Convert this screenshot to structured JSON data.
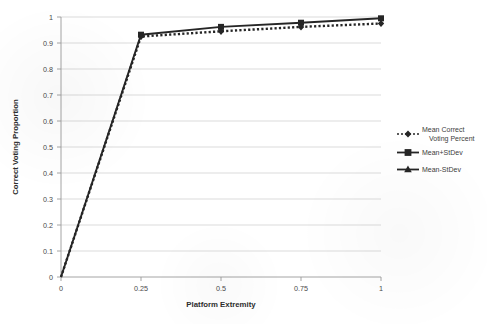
{
  "chart_data": {
    "type": "line",
    "title": "",
    "xlabel": "Platform Extremity",
    "ylabel": "Correct Voting Proportion",
    "x": [
      0,
      0.25,
      0.5,
      0.75,
      1
    ],
    "xticklabels": [
      "0",
      "0.25",
      "0.5",
      "0.75",
      "1"
    ],
    "yticklabels": [
      "0",
      "0.1",
      "0.2",
      "0.3",
      "0.4",
      "0.5",
      "0.6",
      "0.7",
      "0.8",
      "0.9",
      "1"
    ],
    "xlim": [
      0,
      1
    ],
    "ylim": [
      0,
      1
    ],
    "grid": "horizontal",
    "legend_position": "right",
    "series": [
      {
        "name": "Mean Correct Voting Percent",
        "marker": "diamond",
        "linestyle": "dotted",
        "values": [
          0,
          0.925,
          0.945,
          0.962,
          0.975
        ]
      },
      {
        "name": "Mean+StDev",
        "marker": "square",
        "linestyle": "solid",
        "values": [
          0,
          0.932,
          0.962,
          0.978,
          0.995
        ]
      },
      {
        "name": "Mean-StDev",
        "marker": "triangle",
        "linestyle": "solid",
        "values": [
          0,
          0.916,
          0.93,
          0.944,
          0.955
        ]
      }
    ]
  },
  "axes": {
    "y_tick_0": "0",
    "y_tick_1": "0.1",
    "y_tick_2": "0.2",
    "y_tick_3": "0.3",
    "y_tick_4": "0.4",
    "y_tick_5": "0.5",
    "y_tick_6": "0.6",
    "y_tick_7": "0.7",
    "y_tick_8": "0.8",
    "y_tick_9": "0.9",
    "y_tick_10": "1",
    "x_tick_0": "0",
    "x_tick_1": "0.25",
    "x_tick_2": "0.5",
    "x_tick_3": "0.75",
    "x_tick_4": "1",
    "x_title": "Platform Extremity",
    "y_title": "Correct Voting Proportion"
  },
  "legend": {
    "entry_0_line_1": "Mean Correct",
    "entry_0_line_2": "Voting Percent",
    "entry_1": "Mean+StDev",
    "entry_2": "Mean-StDev"
  },
  "colors": {
    "line": "#262626",
    "grid": "#d2d2d2",
    "axis": "#9a9a9a",
    "text": "#3a3a3a",
    "background": "#ffffff"
  }
}
